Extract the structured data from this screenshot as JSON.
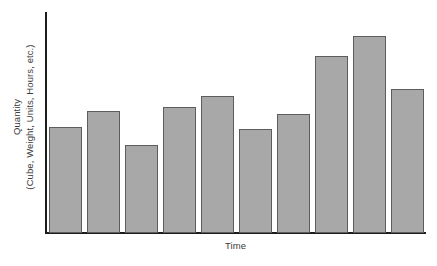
{
  "chart_data": {
    "type": "bar",
    "title": "",
    "subtitle": "",
    "xlabel": "Time",
    "ylabel_line1": "Quantity",
    "ylabel_line2": "(Cube, Weight, Units, Hours, etc.)",
    "ylabel_full": "Quantity (Cube, Weight, Units, Hours, etc.)",
    "categories": [
      "1",
      "2",
      "3",
      "4",
      "5",
      "6",
      "7",
      "8",
      "9",
      "10"
    ],
    "values": [
      48,
      55,
      40,
      57,
      62,
      47,
      54,
      80,
      89,
      65
    ],
    "ylim": [
      0,
      100
    ],
    "xlim_categories": 10,
    "grid": false,
    "legend": null,
    "tick_labels_x": [],
    "tick_labels_y": [],
    "annotations": [],
    "bar_fill_color": "#a8a8a8",
    "bar_edge_color": "#5d5d5d",
    "axis_color": "#1c1c1c",
    "text_color": "#3a3a3a",
    "background_color": "#ffffff"
  }
}
